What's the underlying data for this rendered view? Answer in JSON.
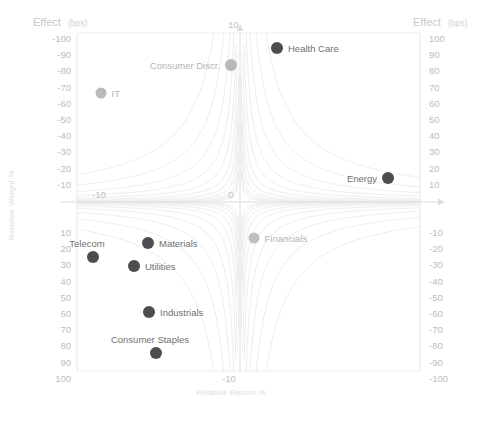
{
  "chart_data": {
    "type": "scatter",
    "title": "",
    "xlabel": "Relative Return %",
    "ylabel": "Relative Weight %",
    "y2label": "Effect (bps)",
    "y2label_sub": "(bps)",
    "xlim": [
      -10,
      10
    ],
    "ylim_left": [
      -100,
      100
    ],
    "ylim_right": [
      -100,
      100
    ],
    "grid": false,
    "contours": "hyperbolic constant-effect isolines",
    "left_axis_title": "Effect",
    "left_axis_title_sub": "(bps)",
    "right_axis_title": "Effect",
    "right_axis_title_sub": "(bps)",
    "left_ticks_upper": [
      "-100",
      "-90",
      "-80",
      "-70",
      "-60",
      "-50",
      "-40",
      "-30",
      "-20",
      "-10"
    ],
    "left_ticks_lower": [
      "10",
      "20",
      "30",
      "40",
      "50",
      "60",
      "70",
      "80",
      "90",
      "100"
    ],
    "right_ticks_upper": [
      "100",
      "90",
      "80",
      "70",
      "60",
      "50",
      "40",
      "30",
      "20",
      "10"
    ],
    "right_ticks_lower": [
      "-10",
      "-20",
      "-30",
      "-40",
      "-50",
      "-60",
      "-70",
      "-80",
      "-90",
      "-100"
    ],
    "x_tick_left": "-10",
    "x_tick_center": "0",
    "x_tick_right": "-10",
    "y_tick_top": "10",
    "points": [
      {
        "name": "Health Care",
        "x_px": 277,
        "y_px": 48,
        "label_side": "right",
        "color": "#4d4d4d",
        "r": 6.0
      },
      {
        "name": "Consumer Discr.",
        "x_px": 231,
        "y_px": 65,
        "label_side": "left",
        "color": "#b9b9b9",
        "r": 6.0
      },
      {
        "name": "IT",
        "x_px": 101,
        "y_px": 93,
        "label_side": "right",
        "color": "#b9b9b9",
        "r": 5.5
      },
      {
        "name": "Energy",
        "x_px": 388,
        "y_px": 178,
        "label_side": "left",
        "color": "#4d4d4d",
        "r": 6.0
      },
      {
        "name": "Financials",
        "x_px": 254,
        "y_px": 238,
        "label_side": "right",
        "color": "#bfbfbf",
        "r": 5.5
      },
      {
        "name": "Materials",
        "x_px": 148,
        "y_px": 243,
        "label_side": "right",
        "color": "#4d4d4d",
        "r": 6.0
      },
      {
        "name": "Telecom",
        "x_px": 93,
        "y_px": 257,
        "label_side": "above",
        "color": "#4d4d4d",
        "r": 6.0
      },
      {
        "name": "Utilities",
        "x_px": 134,
        "y_px": 266,
        "label_side": "right",
        "color": "#4d4d4d",
        "r": 6.0
      },
      {
        "name": "Industrials",
        "x_px": 149,
        "y_px": 312,
        "label_side": "right",
        "color": "#4d4d4d",
        "r": 6.0
      },
      {
        "name": "Consumer Staples",
        "x_px": 156,
        "y_px": 353,
        "label_side": "above",
        "color": "#4d4d4d",
        "r": 6.0
      }
    ]
  },
  "colors": {
    "marker_dark": "#4d4d4d",
    "marker_light": "#bcbcbc",
    "contour": "#ededed",
    "axis": "#e2e2e2",
    "tick_text": "#bdbdbd",
    "title_text": "#c9c9c9",
    "label_text": "#707070"
  },
  "caption": ""
}
